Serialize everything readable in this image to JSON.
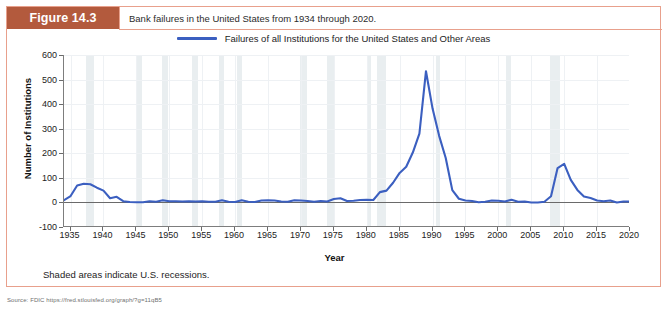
{
  "figure": {
    "tag": "Figure 14.3",
    "caption": "Bank failures in the United States from 1934 through 2020.",
    "footnote": "Shaded areas indicate U.S. recessions.",
    "source": "Source: FDIC https://fred.stlouisfed.org/graph/?g=11qB5"
  },
  "colors": {
    "tag_background": "#b35a3d",
    "frame_border": "#e8a08c",
    "series_line": "#3b5fc0",
    "recession_band": "#e9eef0",
    "gridline": "#eef1f4",
    "axis": "#6a6a6a"
  },
  "chart_data": {
    "type": "line",
    "title": "",
    "xlabel": "Year",
    "ylabel": "Number of Institutions",
    "xlim": [
      1934,
      2020
    ],
    "ylim": [
      -100,
      600
    ],
    "yticks": [
      600,
      500,
      400,
      300,
      200,
      100,
      0,
      -100
    ],
    "xticks": [
      1935,
      1940,
      1945,
      1950,
      1955,
      1960,
      1965,
      1970,
      1975,
      1980,
      1985,
      1990,
      1995,
      2000,
      2005,
      2010,
      2015,
      2020
    ],
    "grid": true,
    "legend_position": "top-center",
    "series": [
      {
        "name": "Failures of all Institutions for the United States and Other Areas",
        "color": "#3b5fc0",
        "x": [
          1934,
          1935,
          1936,
          1937,
          1938,
          1939,
          1940,
          1941,
          1942,
          1943,
          1944,
          1945,
          1946,
          1947,
          1948,
          1949,
          1950,
          1951,
          1952,
          1953,
          1954,
          1955,
          1956,
          1957,
          1958,
          1959,
          1960,
          1961,
          1962,
          1963,
          1964,
          1965,
          1966,
          1967,
          1968,
          1969,
          1970,
          1971,
          1972,
          1973,
          1974,
          1975,
          1976,
          1977,
          1978,
          1979,
          1980,
          1981,
          1982,
          1983,
          1984,
          1985,
          1986,
          1987,
          1988,
          1989,
          1990,
          1991,
          1992,
          1993,
          1994,
          1995,
          1996,
          1997,
          1998,
          1999,
          2000,
          2001,
          2002,
          2003,
          2004,
          2005,
          2006,
          2007,
          2008,
          2009,
          2010,
          2011,
          2012,
          2013,
          2014,
          2015,
          2016,
          2017,
          2018,
          2019,
          2020
        ],
        "y": [
          9,
          26,
          69,
          76,
          74,
          60,
          48,
          17,
          23,
          5,
          2,
          1,
          1,
          5,
          3,
          9,
          5,
          5,
          4,
          5,
          4,
          5,
          3,
          3,
          9,
          3,
          2,
          9,
          3,
          2,
          8,
          9,
          8,
          4,
          3,
          9,
          8,
          6,
          3,
          6,
          4,
          14,
          17,
          6,
          7,
          10,
          11,
          10,
          42,
          48,
          80,
          120,
          145,
          203,
          280,
          534,
          382,
          271,
          181,
          50,
          15,
          8,
          6,
          1,
          3,
          8,
          7,
          4,
          11,
          3,
          4,
          0,
          0,
          3,
          25,
          140,
          157,
          92,
          51,
          24,
          18,
          8,
          5,
          8,
          0,
          4,
          4
        ]
      }
    ],
    "recessions": [
      {
        "start": 1937.4,
        "end": 1938.5
      },
      {
        "start": 1945.1,
        "end": 1945.8
      },
      {
        "start": 1948.9,
        "end": 1949.8
      },
      {
        "start": 1953.5,
        "end": 1954.4
      },
      {
        "start": 1957.6,
        "end": 1958.3
      },
      {
        "start": 1960.3,
        "end": 1961.1
      },
      {
        "start": 1969.9,
        "end": 1970.9
      },
      {
        "start": 1973.9,
        "end": 1975.2
      },
      {
        "start": 1980.0,
        "end": 1980.6
      },
      {
        "start": 1981.5,
        "end": 1982.9
      },
      {
        "start": 1990.5,
        "end": 1991.2
      },
      {
        "start": 2001.2,
        "end": 2001.9
      },
      {
        "start": 2007.9,
        "end": 2009.4
      },
      {
        "start": 2020.1,
        "end": 2020.4
      }
    ]
  }
}
